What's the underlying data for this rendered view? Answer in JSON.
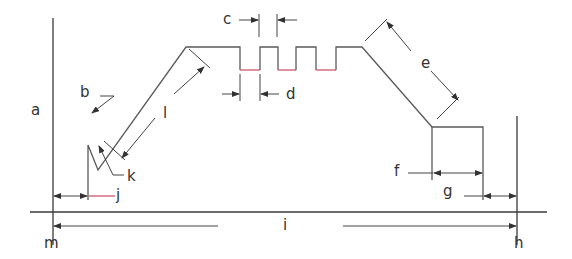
{
  "diagram": {
    "type": "dimensioned profile drawing",
    "labels": {
      "a": "a",
      "b": "b",
      "c": "c",
      "d": "d",
      "e": "e",
      "f": "f",
      "g": "g",
      "h": "h",
      "i": "i",
      "j": "j",
      "k": "k",
      "l": "l",
      "m": "m"
    },
    "colors": {
      "line": "#5a5a5a",
      "baseline": "#3a3a3a",
      "slot_bottom": "#d0566a",
      "text": "#333333",
      "background": "#ffffff"
    }
  }
}
